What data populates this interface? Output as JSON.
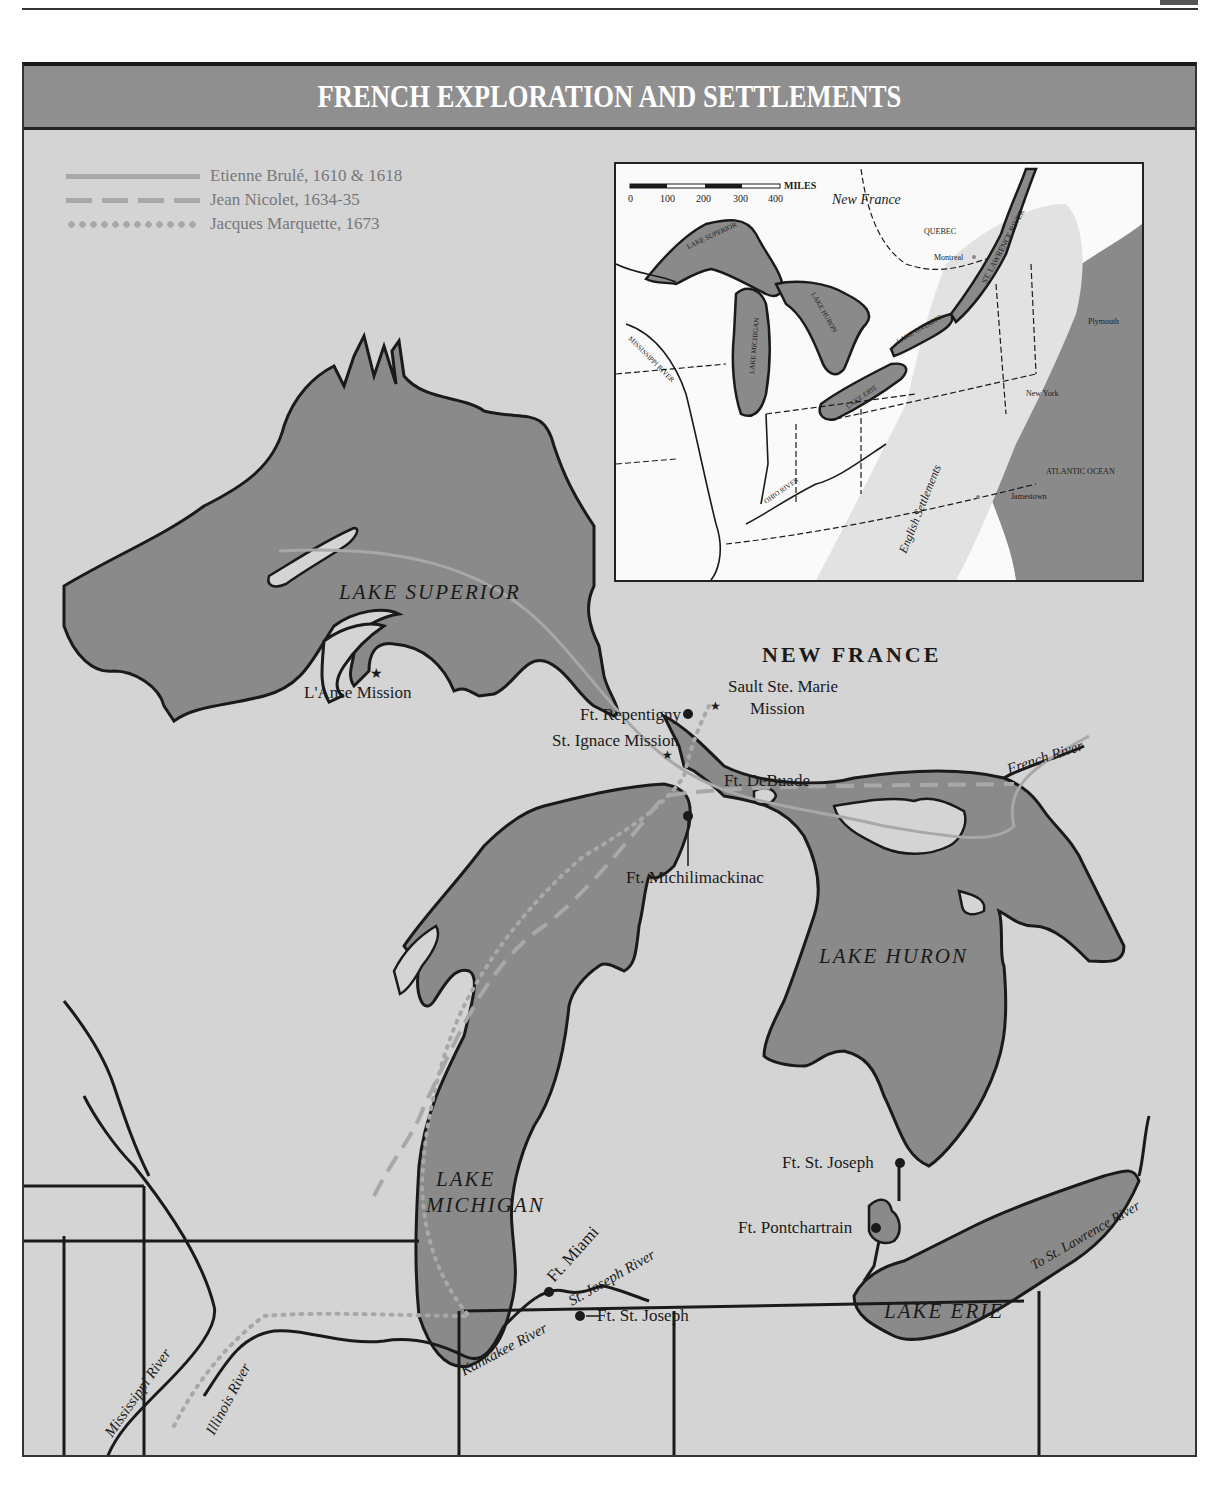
{
  "page": {
    "header_rule": true
  },
  "map": {
    "title": "FRENCH EXPLORATION AND SETTLEMENTS",
    "colors": {
      "water": "#8a8a8a",
      "land": "#d4d4d4",
      "inset_land": "#f5f5f5",
      "route": "#a8a8a8",
      "ink": "#1a1a1a",
      "title_bar": "#8f8f8f"
    },
    "legend": [
      {
        "label": "Etienne Brulé, 1610 & 1618",
        "style": "solid"
      },
      {
        "label": "Jean Nicolet, 1634-35",
        "style": "dashed"
      },
      {
        "label": "Jacques Marquette, 1673",
        "style": "dotted"
      }
    ],
    "region_label": "NEW FRANCE",
    "lakes": [
      "LAKE SUPERIOR",
      "LAKE HURON",
      "LAKE MICHIGAN",
      "LAKE ERIE"
    ],
    "lake_michigan_lines": [
      "LAKE",
      "MICHIGAN"
    ],
    "places": {
      "lanse": "L'Anse Mission",
      "sault_1": "Sault Ste. Marie",
      "sault_2": "Mission",
      "repentigny": "Ft. Repentigny",
      "st_ignace": "St. Ignace Mission",
      "debuade": "Ft. DeBuade",
      "michilimackinac": "Ft. Michilimackinac",
      "st_joseph_north": "Ft. St. Joseph",
      "pontchartrain": "Ft. Pontchartrain",
      "miami": "Ft. Miami",
      "st_joseph_south": "Ft. St. Joseph"
    },
    "rivers": {
      "french": "French River",
      "st_joseph": "St. Joseph River",
      "kankakee": "Kankakee River",
      "illinois": "Illinois River",
      "mississippi": "Mississippi River",
      "to_st_lawrence": "To St. Lawrence River"
    }
  },
  "inset": {
    "scale_label": "MILES",
    "scale_ticks": [
      "0",
      "100",
      "200",
      "300",
      "400"
    ],
    "new_france": "New France",
    "quebec": "QUEBEC",
    "montreal": "Montreal",
    "st_lawrence": "ST. LAWRENCE RIVER",
    "lake_superior": "LAKE SUPERIOR",
    "lake_huron": "LAKE HURON",
    "lake_michigan": "LAKE MICHIGAN",
    "lake_ontario": "LAKE ONTARIO",
    "lake_erie": "LAKE ERIE",
    "mississippi": "MISSISSIPPI RIVER",
    "ohio": "OHIO RIVER",
    "plymouth": "Plymouth",
    "new_york": "New York",
    "atlantic": "ATLANTIC OCEAN",
    "jamestown": "Jamestown",
    "english": "English Settlements"
  }
}
